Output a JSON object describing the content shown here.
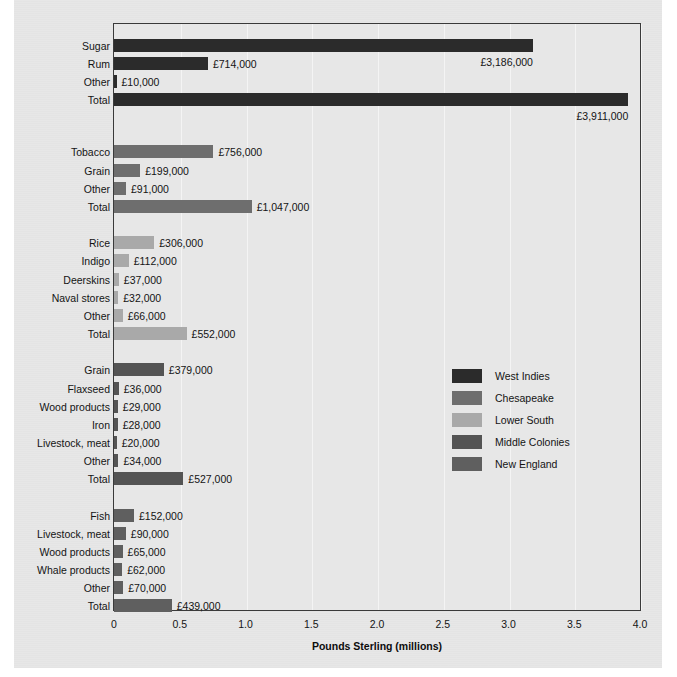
{
  "chart_data": {
    "type": "bar",
    "orientation": "horizontal",
    "title": "",
    "xlabel": "Pounds Sterling (millions)",
    "ylabel": "",
    "xlim": [
      0,
      4.0
    ],
    "xticks": [
      "0",
      "0.5",
      "1.0",
      "1.5",
      "2.0",
      "2.5",
      "3.0",
      "3.5",
      "4.0"
    ],
    "xtick_values": [
      0,
      0.5,
      1.0,
      1.5,
      2.0,
      2.5,
      3.0,
      3.5,
      4.0
    ],
    "grid": "vertical",
    "legend_position": "center-right",
    "value_unit": "pounds sterling",
    "groups": [
      {
        "name": "West Indies",
        "color": "#2b2b2b",
        "rows": [
          {
            "label": "Sugar",
            "value": 3186000,
            "value_label": "£3,186,000",
            "millions": 3.186
          },
          {
            "label": "Rum",
            "value": 714000,
            "value_label": "£714,000",
            "millions": 0.714
          },
          {
            "label": "Other",
            "value": 10000,
            "value_label": "£10,000",
            "millions": 0.01
          },
          {
            "label": "Total",
            "value": 3911000,
            "value_label": "£3,911,000",
            "millions": 3.911
          }
        ]
      },
      {
        "name": "Chesapeake",
        "color": "#6e6e6e",
        "rows": [
          {
            "label": "Tobacco",
            "value": 756000,
            "value_label": "£756,000",
            "millions": 0.756
          },
          {
            "label": "Grain",
            "value": 199000,
            "value_label": "£199,000",
            "millions": 0.199
          },
          {
            "label": "Other",
            "value": 91000,
            "value_label": "£91,000",
            "millions": 0.091
          },
          {
            "label": "Total",
            "value": 1047000,
            "value_label": "£1,047,000",
            "millions": 1.047
          }
        ]
      },
      {
        "name": "Lower South",
        "color": "#a9a9a9",
        "rows": [
          {
            "label": "Rice",
            "value": 306000,
            "value_label": "£306,000",
            "millions": 0.306
          },
          {
            "label": "Indigo",
            "value": 112000,
            "value_label": "£112,000",
            "millions": 0.112
          },
          {
            "label": "Deerskins",
            "value": 37000,
            "value_label": "£37,000",
            "millions": 0.037
          },
          {
            "label": "Naval stores",
            "value": 32000,
            "value_label": "£32,000",
            "millions": 0.032
          },
          {
            "label": "Other",
            "value": 66000,
            "value_label": "£66,000",
            "millions": 0.066
          },
          {
            "label": "Total",
            "value": 552000,
            "value_label": "£552,000",
            "millions": 0.552
          }
        ]
      },
      {
        "name": "Middle Colonies",
        "color": "#545454",
        "rows": [
          {
            "label": "Grain",
            "value": 379000,
            "value_label": "£379,000",
            "millions": 0.379
          },
          {
            "label": "Flaxseed",
            "value": 36000,
            "value_label": "£36,000",
            "millions": 0.036
          },
          {
            "label": "Wood products",
            "value": 29000,
            "value_label": "£29,000",
            "millions": 0.029
          },
          {
            "label": "Iron",
            "value": 28000,
            "value_label": "£28,000",
            "millions": 0.028
          },
          {
            "label": "Livestock, meat",
            "value": 20000,
            "value_label": "£20,000",
            "millions": 0.02
          },
          {
            "label": "Other",
            "value": 34000,
            "value_label": "£34,000",
            "millions": 0.034
          },
          {
            "label": "Total",
            "value": 527000,
            "value_label": "£527,000",
            "millions": 0.527
          }
        ]
      },
      {
        "name": "New England",
        "color": "#5f5f5f",
        "rows": [
          {
            "label": "Fish",
            "value": 152000,
            "value_label": "£152,000",
            "millions": 0.152
          },
          {
            "label": "Livestock, meat",
            "value": 90000,
            "value_label": "£90,000",
            "millions": 0.09
          },
          {
            "label": "Wood products",
            "value": 65000,
            "value_label": "£65,000",
            "millions": 0.065
          },
          {
            "label": "Whale products",
            "value": 62000,
            "value_label": "£62,000",
            "millions": 0.062
          },
          {
            "label": "Other",
            "value": 70000,
            "value_label": "£70,000",
            "millions": 0.07
          },
          {
            "label": "Total",
            "value": 439000,
            "value_label": "£439,000",
            "millions": 0.439
          }
        ]
      }
    ],
    "legend": [
      {
        "label": "West Indies",
        "color": "#2b2b2b"
      },
      {
        "label": "Chesapeake",
        "color": "#6e6e6e"
      },
      {
        "label": "Lower South",
        "color": "#a9a9a9"
      },
      {
        "label": "Middle Colonies",
        "color": "#545454"
      },
      {
        "label": "New England",
        "color": "#5f5f5f"
      }
    ]
  }
}
